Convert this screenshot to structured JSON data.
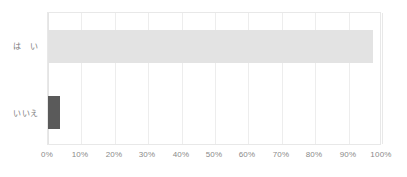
{
  "chart_data": {
    "type": "bar",
    "orientation": "horizontal",
    "title": "",
    "subtitle": "",
    "xlabel": "",
    "ylabel": "",
    "categories": [
      "は　い",
      "いいえ"
    ],
    "values": [
      97.3,
      3.5
    ],
    "value_suffix": "%",
    "xlim": [
      0,
      100
    ],
    "xticks": [
      0,
      10,
      20,
      30,
      40,
      50,
      60,
      70,
      80,
      90,
      100
    ],
    "xtick_labels": [
      "0%",
      "10%",
      "20%",
      "30%",
      "40%",
      "50%",
      "60%",
      "70%",
      "80%",
      "90%",
      "100%"
    ],
    "grid": true,
    "grid_axis": "x",
    "legend": false,
    "legend_position": "none",
    "bar_colors": [
      "#e3e3e3",
      "#5a5a5a"
    ],
    "series": [
      {
        "name": "",
        "values": [
          97.3,
          3.5
        ]
      }
    ]
  },
  "style": {
    "background": "#ffffff",
    "plot_border_color": "#e8e8e8",
    "gridline_color": "#ededed",
    "tick_label_color": "#8a8a8a",
    "category_label_color": "#7d7d7d",
    "bar_light": "#e3e3e3",
    "bar_dark": "#5a5a5a"
  }
}
